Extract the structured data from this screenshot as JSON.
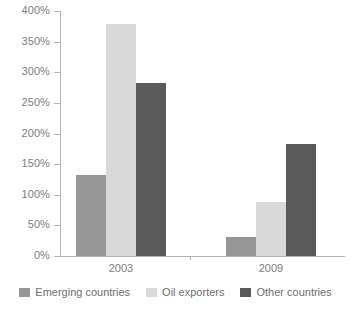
{
  "chart_data": {
    "type": "bar",
    "title": "",
    "subtitle": "",
    "xlabel": "",
    "ylabel": "",
    "categories": [
      "2003",
      "2009"
    ],
    "series": [
      {
        "name": "Emerging countries",
        "color": "#969696",
        "values": [
          133,
          31
        ]
      },
      {
        "name": "Oil exporters",
        "color": "#d9d9d9",
        "values": [
          378,
          88
        ]
      },
      {
        "name": "Other countries",
        "color": "#5a5a5a",
        "values": [
          283,
          183
        ]
      }
    ],
    "ylim": [
      0,
      400
    ],
    "ytick_values": [
      0,
      50,
      100,
      150,
      200,
      250,
      300,
      350,
      400
    ],
    "ytick_labels": [
      "0%",
      "50%",
      "100%",
      "150%",
      "200%",
      "250%",
      "300%",
      "350%",
      "400%"
    ],
    "grid": false,
    "legend_position": "bottom",
    "axis_color": "#b3b3b3",
    "text_color": "#7d7d7d",
    "background": "#ffffff"
  },
  "axis": {
    "y_ticks": [
      {
        "label": "400%",
        "value": 400
      },
      {
        "label": "350%",
        "value": 350
      },
      {
        "label": "300%",
        "value": 300
      },
      {
        "label": "250%",
        "value": 250
      },
      {
        "label": "200%",
        "value": 200
      },
      {
        "label": "150%",
        "value": 150
      },
      {
        "label": "100%",
        "value": 100
      },
      {
        "label": "50%",
        "value": 50
      },
      {
        "label": "0%",
        "value": 0
      }
    ],
    "x_labels": [
      "2003",
      "2009"
    ]
  },
  "legend": {
    "items": [
      {
        "label": "Emerging countries",
        "color": "#969696"
      },
      {
        "label": "Oil exporters",
        "color": "#d9d9d9"
      },
      {
        "label": "Other countries",
        "color": "#5a5a5a"
      }
    ]
  }
}
